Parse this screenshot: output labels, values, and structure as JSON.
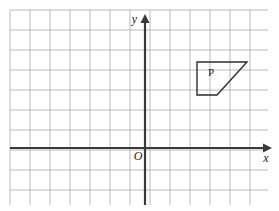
{
  "figure": {
    "type": "coordinate-grid-diagram",
    "width": 279,
    "height": 211,
    "background_color": "#ffffff"
  },
  "grid": {
    "columns": 13,
    "rows": 10,
    "cell_size": 20,
    "left": 10,
    "top": 10,
    "right": 268,
    "bottom": 205,
    "line_color": "#b6b8bd",
    "line_width": 1,
    "visible": true
  },
  "axes": {
    "color": "#3a3a3a",
    "line_width": 2.2,
    "origin": {
      "x": 145,
      "y": 148
    },
    "x_axis": {
      "label": "x",
      "label_style": "italic",
      "start_x": 10,
      "end_x": 272,
      "y": 148,
      "arrow": "right"
    },
    "y_axis": {
      "label": "y",
      "label_style": "italic",
      "x": 145,
      "start_y": 205,
      "end_y": 14,
      "arrow": "up"
    },
    "origin_label": {
      "text": "O",
      "style": "italic",
      "x": 138,
      "y": 160
    }
  },
  "shapes": [
    {
      "name": "P",
      "label": "P",
      "label_position": {
        "x": 211,
        "y": 76
      },
      "outline_color": "#2b2b2b",
      "fill": "none",
      "line_width": 1.4,
      "type": "trapezoid",
      "vertices_px": [
        {
          "x": 197,
          "y": 62
        },
        {
          "x": 247,
          "y": 62
        },
        {
          "x": 217,
          "y": 95
        },
        {
          "x": 197,
          "y": 95
        }
      ],
      "vertices_grid": [
        {
          "x": 2.6,
          "y": 4.3
        },
        {
          "x": 5.1,
          "y": 4.3
        },
        {
          "x": 3.6,
          "y": 2.65
        },
        {
          "x": 2.6,
          "y": 2.65
        }
      ]
    }
  ]
}
